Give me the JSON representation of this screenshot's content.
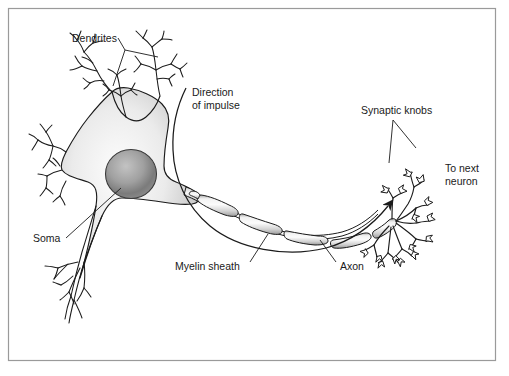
{
  "figure": {
    "type": "biological-diagram",
    "subject": "neuron",
    "frame": {
      "border_color": "#9a9a9a",
      "background_color": "#ffffff"
    }
  },
  "palette": {
    "outline": "#1b1b1b",
    "soma_fill_light": "#fcfcfc",
    "soma_fill_mid": "#e2e2e2",
    "soma_fill_dark": "#b8b8b8",
    "nucleus_light": "#b9b9b9",
    "nucleus_dark": "#6e6e6e",
    "myelin_light": "#f4f4f4",
    "myelin_mid": "#d5d5d5",
    "myelin_dark": "#9d9d9d",
    "text": "#1a1a1a",
    "frame": "#9a9a9a"
  },
  "labels": [
    {
      "id": "dendrites",
      "text": "Dendrites",
      "lines": [
        "Dendrites"
      ],
      "x": 72,
      "y": 42,
      "anchor": "start",
      "leader": "bracket"
    },
    {
      "id": "direction-of-impulse",
      "text": "Direction of impulse",
      "lines": [
        "Direction",
        "of impulse"
      ],
      "x": 192,
      "y": 96,
      "anchor": "start",
      "leader": "none"
    },
    {
      "id": "synaptic-knobs",
      "text": "Synaptic knobs",
      "lines": [
        "Synaptic knobs"
      ],
      "x": 361,
      "y": 114,
      "anchor": "start",
      "leader": "fork"
    },
    {
      "id": "to-next-neuron",
      "text": "To next neuron",
      "lines": [
        "To next",
        "neuron"
      ],
      "x": 445,
      "y": 172,
      "anchor": "start",
      "leader": "none"
    },
    {
      "id": "soma",
      "text": "Soma",
      "lines": [
        "Soma"
      ],
      "x": 33,
      "y": 242,
      "anchor": "start",
      "leader": "line"
    },
    {
      "id": "myelin-sheath",
      "text": "Myelin sheath",
      "lines": [
        "Myelin sheath"
      ],
      "x": 175,
      "y": 270,
      "anchor": "start",
      "leader": "line"
    },
    {
      "id": "axon",
      "text": "Axon",
      "lines": [
        "Axon"
      ],
      "x": 340,
      "y": 270,
      "anchor": "start",
      "leader": "line"
    }
  ],
  "parts": {
    "soma": {
      "name": "Soma",
      "description": "Cell body with gradient shading"
    },
    "nucleus": {
      "name": "Nucleus",
      "description": "Dark gray round nucleus inside the soma"
    },
    "dendrites": {
      "name": "Dendrites",
      "count": 4,
      "description": "Branching tree-like processes on the left of the soma"
    },
    "axon": {
      "name": "Axon",
      "description": "Long curving process running right from the soma"
    },
    "myelin_segments": {
      "name": "Myelin sheath",
      "count": 6,
      "description": "Capsule-shaped sheath segments along the axon"
    },
    "synaptic_knobs": {
      "name": "Synaptic knobs",
      "description": "Terminal branches ending in small triangular knobs"
    },
    "impulse_arrow": {
      "name": "Direction of impulse",
      "description": "Long curved arrow sweeping from the soma to the axon terminals"
    }
  }
}
